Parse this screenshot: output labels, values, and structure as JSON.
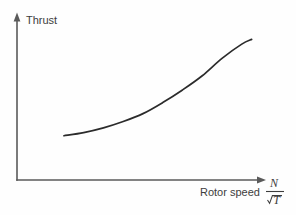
{
  "figure": {
    "background_color": "#fefefe",
    "axis_color": "#5a5a5a",
    "curve_color": "#2b2b2b",
    "text_color": "#3d3d3d",
    "y_axis_label": "Thrust",
    "x_axis_label": "Rotor speed",
    "x_axis_symbol_numerator": "N",
    "x_axis_symbol_denominator": "T"
  },
  "chart_data": {
    "type": "line",
    "title": "",
    "xlabel": "Rotor speed N/√T",
    "ylabel": "Thrust",
    "grid": false,
    "legend": "none",
    "axis_arrows": true,
    "tick_labels_x": [],
    "tick_labels_y": [],
    "xlim": [
      0,
      1
    ],
    "ylim": [
      0,
      1
    ],
    "series": [
      {
        "name": "Thrust curve",
        "x": [
          0.19,
          0.27,
          0.35,
          0.43,
          0.51,
          0.59,
          0.67,
          0.75,
          0.83,
          0.91,
          0.95
        ],
        "y": [
          0.28,
          0.3,
          0.33,
          0.37,
          0.42,
          0.49,
          0.57,
          0.66,
          0.77,
          0.86,
          0.89
        ]
      }
    ],
    "annotations": []
  }
}
